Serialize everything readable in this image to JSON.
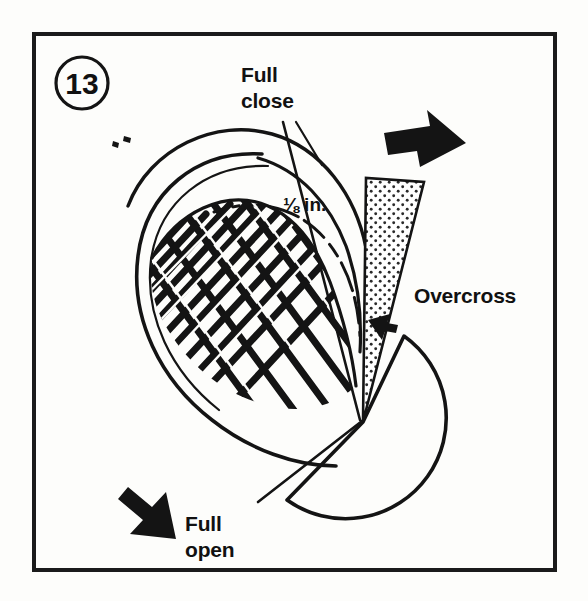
{
  "figure": {
    "number_badge": "13",
    "frame_color": "#1b1b1b",
    "ink_color": "#141414",
    "background_color": "#fdfdfb",
    "stipple_color": "#2a2a2a"
  },
  "labels": {
    "full_close": {
      "line1": "Full",
      "line2": "close"
    },
    "dimension": "⅛ in.",
    "overcross": "Overcross",
    "full_open": {
      "line1": "Full",
      "line2": "open"
    }
  },
  "icons": {
    "arrow_right": "block-arrow-right-icon",
    "arrow_down_left": "block-arrow-down-left-icon",
    "wedge_pointer": "small-arrowhead-left-icon"
  }
}
